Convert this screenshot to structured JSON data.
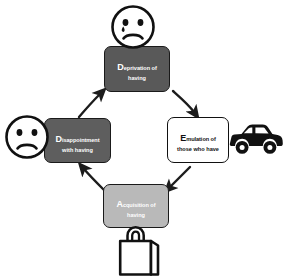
{
  "diagram": {
    "type": "cycle-diagram",
    "background_color": "#ffffff",
    "nodes": [
      {
        "id": "deprivation",
        "initial": "D",
        "rest_of_word": "eprivation of",
        "second_line": "having",
        "full_label": "Deprivation of having",
        "fill_color": "#595959",
        "text_color": "#ffffff",
        "border_color": "#1a1a1a",
        "position": "top"
      },
      {
        "id": "emulation",
        "initial": "E",
        "rest_of_word": "mulation of",
        "second_line": "those who have",
        "full_label": "Emulation of those who have",
        "fill_color": "#ffffff",
        "text_color": "#111111",
        "border_color": "#111111",
        "position": "right"
      },
      {
        "id": "acquisition",
        "initial": "A",
        "rest_of_word": "cquisition of",
        "second_line": "having",
        "full_label": "Acquisition of having",
        "fill_color": "#b9b9b9",
        "text_color": "#ffffff",
        "border_color": "#1a1a1a",
        "position": "bottom"
      },
      {
        "id": "disappointment",
        "initial": "D",
        "rest_of_word": "isappointment",
        "second_line": "with having",
        "full_label": "Disappointment with having",
        "fill_color": "#5e5e5e",
        "text_color": "#ffffff",
        "border_color": "#1a1a1a",
        "position": "left"
      }
    ],
    "arrows": [
      {
        "id": "deprivation-to-emulation",
        "from": "deprivation",
        "to": "emulation",
        "direction": "down-right"
      },
      {
        "id": "emulation-to-acquisition",
        "from": "emulation",
        "to": "acquisition",
        "direction": "down-left"
      },
      {
        "id": "acquisition-to-disappointment",
        "from": "acquisition",
        "to": "disappointment",
        "direction": "up-left"
      },
      {
        "id": "disappointment-to-deprivation",
        "from": "disappointment",
        "to": "deprivation",
        "direction": "up-right"
      }
    ],
    "icons": [
      {
        "id": "face-top",
        "name": "sad-face-with-tear-icon",
        "description": "Sad face with tear",
        "attached_to": "deprivation",
        "color": "#111111"
      },
      {
        "id": "face-left",
        "name": "sad-face-icon",
        "description": "Sad face",
        "attached_to": "disappointment",
        "color": "#111111"
      },
      {
        "id": "car",
        "name": "car-icon",
        "description": "Car silhouette",
        "attached_to": "emulation",
        "color": "#111111"
      },
      {
        "id": "bag",
        "name": "shopping-bag-icon",
        "description": "Shopping bag",
        "attached_to": "acquisition",
        "color": "#111111"
      }
    ]
  }
}
